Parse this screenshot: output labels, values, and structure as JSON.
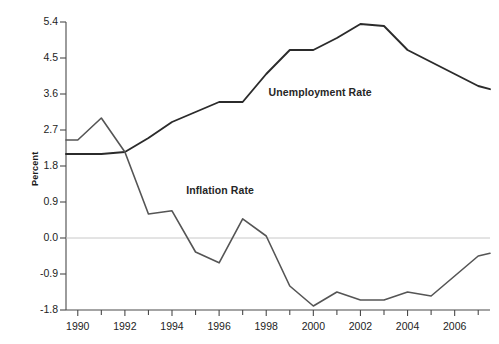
{
  "chart_data": {
    "type": "line",
    "title": "",
    "xlabel": "",
    "ylabel": "Percent",
    "xlim": [
      1989.5,
      2007.5
    ],
    "ylim": [
      -1.8,
      5.4
    ],
    "grid": false,
    "zero_line": true,
    "legend_position": "inline-annotation",
    "x_tick_labels": [
      "1990",
      "1992",
      "1994",
      "1996",
      "1998",
      "2000",
      "2002",
      "2004",
      "2006"
    ],
    "x_tick_values": [
      1990,
      1992,
      1994,
      1996,
      1998,
      2000,
      2002,
      2004,
      2006
    ],
    "x_minor_tick_values": [
      1991,
      1993,
      1995,
      1997,
      1999,
      2001,
      2003,
      2005,
      2007
    ],
    "y_tick_labels": [
      "5.4",
      "4.5",
      "3.6",
      "2.7",
      "1.8",
      "0.9",
      "0.0",
      "-0.9",
      "-1.8"
    ],
    "y_tick_values": [
      5.4,
      4.5,
      3.6,
      2.7,
      1.8,
      0.9,
      0.0,
      -0.9,
      -1.8
    ],
    "x": [
      1989.5,
      1990,
      1991,
      1992,
      1993,
      1994,
      1995,
      1996,
      1997,
      1998,
      1999,
      2000,
      2001,
      2002,
      2003,
      2004,
      2005,
      2006,
      2007,
      2007.5
    ],
    "series": [
      {
        "name": "Unemployment Rate",
        "color": "#2b2b2b",
        "values": [
          2.1,
          2.1,
          2.1,
          2.15,
          2.5,
          2.9,
          3.15,
          3.4,
          3.4,
          4.1,
          4.7,
          4.7,
          5.0,
          5.35,
          5.3,
          4.7,
          4.4,
          4.1,
          3.8,
          3.72
        ],
        "label_x": 1998.1,
        "label_y": 3.62
      },
      {
        "name": "Inflation Rate",
        "color": "#555555",
        "values": [
          2.45,
          2.45,
          3.0,
          2.15,
          0.6,
          0.68,
          -0.35,
          -0.62,
          0.48,
          0.05,
          -1.2,
          -1.7,
          -1.35,
          -1.55,
          -1.55,
          -1.35,
          -1.45,
          -0.95,
          -0.45,
          -0.38
        ],
        "label_x": 1994.6,
        "label_y": 1.18
      }
    ],
    "annotations": [
      {
        "text": "Unemployment Rate"
      },
      {
        "text": "Inflation Rate"
      }
    ],
    "colors": {
      "unemployment_line": "#2b2b2b",
      "inflation_line": "#555555",
      "axis": "#4a4a4a",
      "zero_line": "#c8c8c8",
      "text": "#1d1d1d"
    }
  }
}
